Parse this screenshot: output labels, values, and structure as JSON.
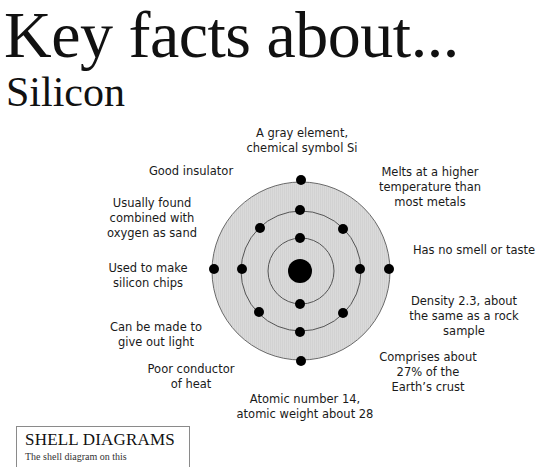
{
  "header": {
    "title": "Key facts about...",
    "subtitle": "Silicon"
  },
  "diagram": {
    "element": "Silicon",
    "symbol": "Si",
    "center": [
      301,
      271
    ],
    "fill_color": "#d9d9d9",
    "ring_color": "#555555",
    "electron_color": "#000000",
    "shells": [
      {
        "name": "inner",
        "radius": 33,
        "electrons": 2
      },
      {
        "name": "middle",
        "radius": 60,
        "electrons": 8
      },
      {
        "name": "outer",
        "radius": 89,
        "electrons": 4
      }
    ],
    "nucleus_radius": 12
  },
  "facts": [
    {
      "id": "top",
      "text": "A gray element,\nchemical symbol Si"
    },
    {
      "id": "insulator",
      "text": "Good insulator"
    },
    {
      "id": "melts",
      "text": "Melts at a higher\ntemperature than\nmost metals"
    },
    {
      "id": "sand",
      "text": "Usually found\ncombined with\noxygen as sand"
    },
    {
      "id": "smell",
      "text": "Has no smell or taste"
    },
    {
      "id": "chips",
      "text": "Used to make\nsilicon chips"
    },
    {
      "id": "density",
      "text": "Density 2.3, about\nthe same as a rock\nsample"
    },
    {
      "id": "light",
      "text": "Can be made to\ngive out light"
    },
    {
      "id": "crust",
      "text": "Comprises about\n27% of the\nEarth’s crust"
    },
    {
      "id": "heat",
      "text": "Poor conductor\nof heat"
    },
    {
      "id": "atomic",
      "text": "Atomic number 14,\natomic weight about 28"
    }
  ],
  "shell_box": {
    "title": "SHELL DIAGRAMS",
    "text": "The shell diagram on this"
  }
}
